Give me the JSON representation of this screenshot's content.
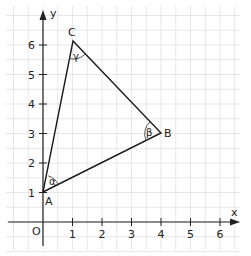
{
  "diagram": {
    "type": "coordinate-triangle",
    "axes": {
      "x_label": "x",
      "y_label": "y",
      "origin_label": "O",
      "x_ticks": [
        "1",
        "2",
        "3",
        "4",
        "5",
        "6"
      ],
      "y_ticks": [
        "1",
        "2",
        "3",
        "4",
        "5",
        "6"
      ]
    },
    "points": [
      {
        "name": "A",
        "x": 0,
        "y": 1
      },
      {
        "name": "B",
        "x": 4,
        "y": 3
      },
      {
        "name": "C",
        "x": 1,
        "y": 6
      }
    ],
    "angles": [
      {
        "vertex": "A",
        "label": "α"
      },
      {
        "vertex": "B",
        "label": "β"
      },
      {
        "vertex": "C",
        "label": "γ"
      }
    ],
    "colors": {
      "grid": "#d9d9d9",
      "axis": "#222222",
      "triangle": "#1a1a1a",
      "angle_arc": "#555555",
      "angle_label": "#666666"
    }
  }
}
